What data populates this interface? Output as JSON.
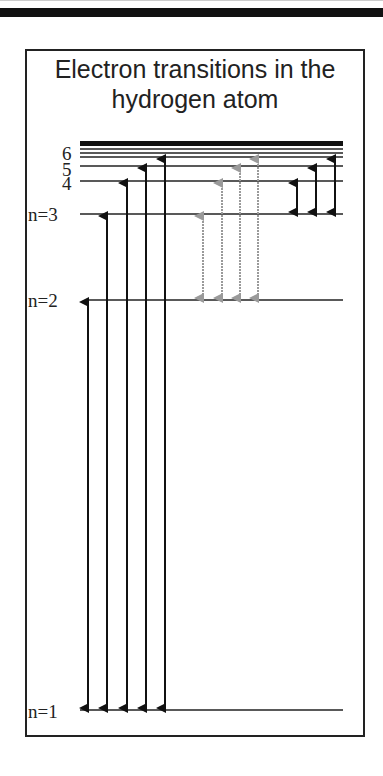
{
  "title": "Electron transitions in the hydrogen atom",
  "title_lines": [
    "Electron transitions in the",
    "hydrogen atom"
  ],
  "colors": {
    "line": "#222222",
    "arrow_black": "#111111",
    "arrow_gray": "#9a9a9a"
  },
  "levels": [
    {
      "n": 1,
      "label": "n=1",
      "y": 710
    },
    {
      "n": 2,
      "label": "n=2",
      "y": 300
    },
    {
      "n": 3,
      "label": "n=3",
      "y": 214
    },
    {
      "n": 4,
      "label": "4",
      "y": 181
    },
    {
      "n": 5,
      "label": "5",
      "y": 166
    },
    {
      "n": 6,
      "label": "6",
      "y": 157
    }
  ],
  "series": [
    {
      "name": "Lyman (to n=1)",
      "color": "black",
      "transitions": [
        [
          1,
          2
        ],
        [
          1,
          3
        ],
        [
          1,
          4
        ],
        [
          1,
          5
        ],
        [
          1,
          6
        ]
      ]
    },
    {
      "name": "Balmer (to n=2)",
      "color": "gray",
      "transitions": [
        [
          2,
          3
        ],
        [
          2,
          4
        ],
        [
          2,
          5
        ],
        [
          2,
          6
        ]
      ]
    },
    {
      "name": "Paschen (to n=3)",
      "color": "black",
      "transitions": [
        [
          3,
          4
        ],
        [
          3,
          5
        ],
        [
          3,
          6
        ]
      ]
    }
  ]
}
